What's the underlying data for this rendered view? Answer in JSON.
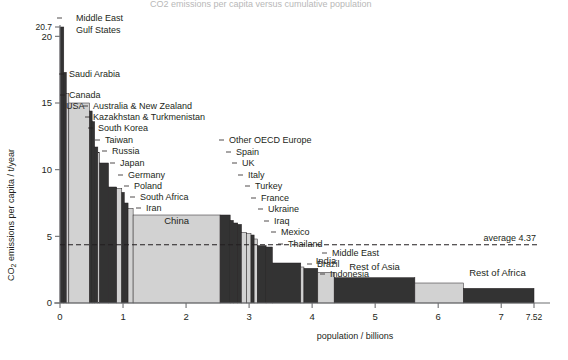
{
  "figure": {
    "clipped_top_title": "CO2 emissions per capita versus population (cumulative), by country",
    "average_label": "average 4.37",
    "average_value": 4.37
  },
  "axes": {
    "y": {
      "title": "CO2 emissions per capita / t/year",
      "title_parts": {
        "pre": "CO",
        "sub": "2",
        "post": " emissions per capita / t/year"
      },
      "ticks": [
        "0",
        "5",
        "10",
        "15",
        "20",
        "20.7"
      ],
      "tick_values": [
        0,
        5,
        10,
        15,
        20,
        20.7
      ],
      "range": [
        0,
        20.7
      ]
    },
    "x": {
      "title": "population / billions",
      "ticks": [
        "0",
        "1",
        "2",
        "3",
        "4",
        "5",
        "6",
        "7",
        "7.52"
      ],
      "tick_values": [
        0,
        1,
        2,
        3,
        4,
        5,
        6,
        7,
        7.52
      ],
      "range": [
        0,
        7.52
      ]
    }
  },
  "chart_data": {
    "type": "bar",
    "title": "CO2 emissions per capita versus cumulative population",
    "xlabel": "population / billions",
    "ylabel": "CO2 emissions per capita / t/year",
    "xlim": [
      0,
      7.52
    ],
    "ylim": [
      0,
      20.7
    ],
    "grid": false,
    "legend": null,
    "annotations": [
      {
        "text": "average 4.37",
        "y": 4.37,
        "type": "horizontal-dashed-line"
      }
    ],
    "note": "Marimekko / variable-width bar chart: bar width = population (billions), bar height = CO2 t per capita per year. x_start and x_end are cumulative population in billions.",
    "bars": [
      {
        "label": "Middle East Gulf States",
        "x_start": 0.0,
        "x_end": 0.06,
        "value": 20.7,
        "shade": "dark",
        "label_mode": "leader-top"
      },
      {
        "label": "Saudi Arabia",
        "x_start": 0.06,
        "x_end": 0.1,
        "value": 17.3,
        "shade": "dark",
        "label_mode": "leader-top"
      },
      {
        "label": "Canada",
        "x_start": 0.1,
        "x_end": 0.14,
        "value": 15.7,
        "shade": "light",
        "label_mode": "leader-top"
      },
      {
        "label": "USA",
        "x_start": 0.14,
        "x_end": 0.47,
        "value": 15.0,
        "shade": "light",
        "label_mode": "leader-top"
      },
      {
        "label": "Australia & New Zealand",
        "x_start": 0.47,
        "x_end": 0.51,
        "value": 14.4,
        "shade": "dark",
        "label_mode": "leader-right"
      },
      {
        "label": "Kazakhstan & Turkmenistan",
        "x_start": 0.51,
        "x_end": 0.55,
        "value": 13.6,
        "shade": "dark",
        "label_mode": "leader-right"
      },
      {
        "label": "South Korea",
        "x_start": 0.55,
        "x_end": 0.6,
        "value": 11.7,
        "shade": "dark",
        "label_mode": "leader-right"
      },
      {
        "label": "Taiwan",
        "x_start": 0.6,
        "x_end": 0.63,
        "value": 11.3,
        "shade": "light",
        "label_mode": "leader-right"
      },
      {
        "label": "Russia",
        "x_start": 0.63,
        "x_end": 0.77,
        "value": 10.5,
        "shade": "dark",
        "label_mode": "leader-right"
      },
      {
        "label": "Japan",
        "x_start": 0.77,
        "x_end": 0.9,
        "value": 8.7,
        "shade": "dark",
        "label_mode": "leader-right"
      },
      {
        "label": "Germany",
        "x_start": 0.9,
        "x_end": 0.98,
        "value": 8.6,
        "shade": "light",
        "label_mode": "leader-right"
      },
      {
        "label": "Poland",
        "x_start": 0.98,
        "x_end": 1.02,
        "value": 8.3,
        "shade": "dark",
        "label_mode": "leader-right"
      },
      {
        "label": "South Africa",
        "x_start": 1.02,
        "x_end": 1.08,
        "value": 7.5,
        "shade": "dark",
        "label_mode": "leader-right"
      },
      {
        "label": "Iran",
        "x_start": 1.08,
        "x_end": 1.16,
        "value": 7.1,
        "shade": "light",
        "label_mode": "leader-right"
      },
      {
        "label": "China",
        "x_start": 1.16,
        "x_end": 2.54,
        "value": 6.6,
        "shade": "light",
        "label_mode": "inside"
      },
      {
        "label": "Other OECD Europe",
        "x_start": 2.54,
        "x_end": 2.7,
        "value": 6.6,
        "shade": "dark",
        "label_mode": "leader-top"
      },
      {
        "label": "Spain",
        "x_start": 2.7,
        "x_end": 2.75,
        "value": 6.2,
        "shade": "dark",
        "label_mode": "leader-top"
      },
      {
        "label": "UK",
        "x_start": 2.75,
        "x_end": 2.82,
        "value": 6.0,
        "shade": "dark",
        "label_mode": "leader-top"
      },
      {
        "label": "Italy",
        "x_start": 2.82,
        "x_end": 2.88,
        "value": 5.9,
        "shade": "dark",
        "label_mode": "leader-top"
      },
      {
        "label": "Turkey",
        "x_start": 2.88,
        "x_end": 2.96,
        "value": 5.3,
        "shade": "light",
        "label_mode": "leader-top"
      },
      {
        "label": "France",
        "x_start": 2.96,
        "x_end": 3.03,
        "value": 5.2,
        "shade": "light",
        "label_mode": "leader-top"
      },
      {
        "label": "Ukraine",
        "x_start": 3.03,
        "x_end": 3.08,
        "value": 5.1,
        "shade": "dark",
        "label_mode": "leader-top"
      },
      {
        "label": "Iraq",
        "x_start": 3.08,
        "x_end": 3.13,
        "value": 4.8,
        "shade": "light",
        "label_mode": "leader-top"
      },
      {
        "label": "Mexico",
        "x_start": 3.13,
        "x_end": 3.27,
        "value": 4.3,
        "shade": "dark",
        "label_mode": "leader-top"
      },
      {
        "label": "Thailand",
        "x_start": 3.27,
        "x_end": 3.37,
        "value": 4.2,
        "shade": "dark",
        "label_mode": "leader-top"
      },
      {
        "label": "Middle East",
        "x_start": 3.37,
        "x_end": 3.82,
        "value": 3.0,
        "shade": "dark",
        "label_mode": "leader-right"
      },
      {
        "label": "Brazil",
        "x_start": 3.82,
        "x_end": 3.87,
        "value": 2.7,
        "shade": "light",
        "label_mode": "leader-right"
      },
      {
        "label": "Indonesia",
        "x_start": 3.87,
        "x_end": 4.09,
        "value": 2.6,
        "shade": "dark",
        "label_mode": "leader-right"
      },
      {
        "label": "India",
        "x_start": 4.09,
        "x_end": 4.35,
        "value": 2.3,
        "shade": "light",
        "label_mode": "inside"
      },
      {
        "label": "Rest of Asia",
        "x_start": 4.35,
        "x_end": 5.63,
        "value": 1.9,
        "shade": "dark",
        "label_mode": "inside"
      },
      {
        "label": "Rest of Africa",
        "x_start": 5.63,
        "x_end": 6.4,
        "value": 1.5,
        "shade": "light",
        "label_mode": "inside"
      },
      {
        "label": "Rest of Africa tail",
        "x_start": 6.4,
        "x_end": 7.52,
        "value": 1.1,
        "shade": "dark",
        "label_mode": "none"
      }
    ],
    "inside_labels": [
      {
        "text": "China",
        "x": 1.85,
        "y": 5.9
      },
      {
        "text": "India",
        "x": 4.22,
        "y": 2.95
      },
      {
        "text": "Rest of Asia",
        "x": 4.99,
        "y": 2.45
      },
      {
        "text": "Rest of Africa",
        "x": 6.94,
        "y": 2.05
      }
    ],
    "leader_labels": [
      {
        "text": "Middle East",
        "lx": 76,
        "ly": 18,
        "ax": 62,
        "ay": 18,
        "vy": 30
      },
      {
        "text": "Gulf States",
        "lx": 76,
        "ly": 30,
        "ax": 62,
        "ay": 30,
        "vy": 30,
        "no_leader": true
      },
      {
        "text": "Saudi Arabia",
        "lx": 69,
        "ly": 74,
        "ax": 64,
        "ay": 74,
        "vy": 74
      },
      {
        "text": "Canada",
        "lx": 69,
        "ly": 95,
        "ax": 65,
        "ay": 95,
        "vy": 95
      },
      {
        "text": "USA",
        "lx": 66,
        "ly": 106,
        "ax": 66,
        "ay": 106,
        "no_leader": true
      },
      {
        "text": "Australia & New Zealand",
        "lx": 93,
        "ly": 106,
        "ax": 88,
        "ay": 106,
        "vy": 106
      },
      {
        "text": "Kazakhstan & Turkmenistan",
        "lx": 93,
        "ly": 117,
        "ax": 90,
        "ay": 117,
        "vy": 117
      },
      {
        "text": "South Korea",
        "lx": 98,
        "ly": 128,
        "ax": 93,
        "ay": 128,
        "vy": 128
      },
      {
        "text": "Taiwan",
        "lx": 105,
        "ly": 140,
        "ax": 100,
        "ay": 140,
        "vy": 140
      },
      {
        "text": "Russia",
        "lx": 112,
        "ly": 151,
        "ax": 107,
        "ay": 151,
        "vy": 151
      },
      {
        "text": "Japan",
        "lx": 120,
        "ly": 163,
        "ax": 115,
        "ay": 163,
        "vy": 163
      },
      {
        "text": "Germany",
        "lx": 128,
        "ly": 175,
        "ax": 123,
        "ay": 175,
        "vy": 175
      },
      {
        "text": "Poland",
        "lx": 134,
        "ly": 186,
        "ax": 129,
        "ay": 186,
        "vy": 186
      },
      {
        "text": "South Africa",
        "lx": 140,
        "ly": 197,
        "ax": 135,
        "ay": 197,
        "vy": 197
      },
      {
        "text": "Iran",
        "lx": 146,
        "ly": 208,
        "ax": 141,
        "ay": 208,
        "vy": 208
      },
      {
        "text": "Other OECD Europe",
        "lx": 229,
        "ly": 140,
        "ax": 224,
        "ay": 140,
        "vy": 140
      },
      {
        "text": "Spain",
        "lx": 236,
        "ly": 152,
        "ax": 231,
        "ay": 152,
        "vy": 152
      },
      {
        "text": "UK",
        "lx": 242,
        "ly": 163,
        "ax": 237,
        "ay": 163,
        "vy": 163
      },
      {
        "text": "Italy",
        "lx": 248,
        "ly": 175,
        "ax": 243,
        "ay": 175,
        "vy": 175
      },
      {
        "text": "Turkey",
        "lx": 255,
        "ly": 186,
        "ax": 250,
        "ay": 186,
        "vy": 186
      },
      {
        "text": "France",
        "lx": 261,
        "ly": 198,
        "ax": 256,
        "ay": 198,
        "vy": 198
      },
      {
        "text": "Ukraine",
        "lx": 268,
        "ly": 209,
        "ax": 263,
        "ay": 209,
        "vy": 209
      },
      {
        "text": "Iraq",
        "lx": 274,
        "ly": 221,
        "ax": 269,
        "ay": 221,
        "vy": 221
      },
      {
        "text": "Mexico",
        "lx": 281,
        "ly": 232,
        "ax": 276,
        "ay": 232,
        "vy": 232
      },
      {
        "text": "Thailand",
        "lx": 288,
        "ly": 244,
        "ax": 283,
        "ay": 244,
        "vy": 244
      },
      {
        "text": "Middle East",
        "lx": 332,
        "ly": 253,
        "ax": 327,
        "ay": 253,
        "vy": 253
      },
      {
        "text": "Brazil",
        "lx": 317,
        "ly": 264,
        "ax": 312,
        "ay": 264,
        "vy": 264
      },
      {
        "text": "Indonesia",
        "lx": 330,
        "ly": 274,
        "ax": 325,
        "ay": 274,
        "vy": 274
      }
    ]
  },
  "colors": {
    "light_bar": "#d2d2d2",
    "dark_bar": "#333333",
    "axis": "#6d6e71",
    "text": "#231f20",
    "background": "#ffffff"
  }
}
